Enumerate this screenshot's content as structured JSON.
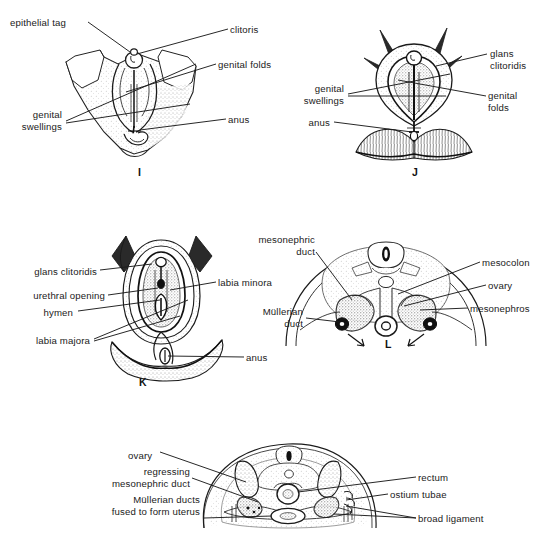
{
  "figure": {
    "background_color": "#ffffff",
    "ink_color": "#1a1a1a",
    "width": 547,
    "height": 549
  },
  "panels": [
    {
      "id": "panel-i",
      "letter": "I",
      "letter_pos": {
        "x": 138,
        "y": 168
      },
      "type": "external-genitalia-perineum",
      "labels": [
        {
          "name": "epithelial-tag",
          "text": "epithelial tag",
          "x": 10,
          "y": 17,
          "align": "left"
        },
        {
          "name": "clitoris",
          "text": "clitoris",
          "x": 230,
          "y": 24,
          "align": "left"
        },
        {
          "name": "genital-folds",
          "text": "genital folds",
          "x": 218,
          "y": 59,
          "align": "left"
        },
        {
          "name": "genital-swellings",
          "text": "genital\nswellings",
          "x": 62,
          "y": 109,
          "align": "right"
        },
        {
          "name": "anus",
          "text": "anus",
          "x": 228,
          "y": 114,
          "align": "left"
        }
      ]
    },
    {
      "id": "panel-j",
      "letter": "J",
      "letter_pos": {
        "x": 412,
        "y": 168
      },
      "type": "external-genitalia-clitoral-hypertrophy",
      "labels": [
        {
          "name": "glans-clitoridis",
          "text": "glans\nclitoridis",
          "x": 490,
          "y": 48,
          "align": "left"
        },
        {
          "name": "genital-swellings",
          "text": "genital\nswellings",
          "x": 344,
          "y": 83,
          "align": "right"
        },
        {
          "name": "genital-folds",
          "text": "genital\nfolds",
          "x": 488,
          "y": 90,
          "align": "left"
        },
        {
          "name": "anus",
          "text": "anus",
          "x": 330,
          "y": 117,
          "align": "right"
        }
      ]
    },
    {
      "id": "panel-k",
      "letter": "K",
      "letter_pos": {
        "x": 139,
        "y": 378
      },
      "type": "definitive-female-external-genitalia",
      "labels": [
        {
          "name": "glans-clitoridis",
          "text": "glans clitoridis",
          "x": 97,
          "y": 266,
          "align": "right"
        },
        {
          "name": "labia-minora",
          "text": "labia minora",
          "x": 218,
          "y": 277,
          "align": "left"
        },
        {
          "name": "urethral-opening",
          "text": "urethral opening",
          "x": 105,
          "y": 290,
          "align": "right"
        },
        {
          "name": "hymen",
          "text": "hymen",
          "x": 73,
          "y": 307,
          "align": "right"
        },
        {
          "name": "labia-majora",
          "text": "labia majora",
          "x": 90,
          "y": 335,
          "align": "right"
        },
        {
          "name": "anus",
          "text": "anus",
          "x": 246,
          "y": 352,
          "align": "left"
        }
      ]
    },
    {
      "id": "panel-l",
      "letter": "L",
      "letter_pos": {
        "x": 385,
        "y": 340
      },
      "type": "transverse-section-gonads-ducts",
      "labels": [
        {
          "name": "mesonephric-duct",
          "text": "mesonephric\nduct",
          "x": 315,
          "y": 234,
          "align": "right"
        },
        {
          "name": "mesocolon",
          "text": "mesocolon",
          "x": 482,
          "y": 257,
          "align": "left"
        },
        {
          "name": "ovary",
          "text": "ovary",
          "x": 488,
          "y": 280,
          "align": "left"
        },
        {
          "name": "mesonephros",
          "text": "mesonephros",
          "x": 470,
          "y": 303,
          "align": "left"
        },
        {
          "name": "mullerian-duct",
          "text": "Müllerian\nduct",
          "x": 303,
          "y": 306,
          "align": "right"
        }
      ]
    },
    {
      "id": "panel-m",
      "letter": "",
      "letter_pos": null,
      "type": "transverse-section-uterus-broad-ligament",
      "labels": [
        {
          "name": "ovary",
          "text": "ovary",
          "x": 128,
          "y": 450,
          "align": "left"
        },
        {
          "name": "regressing-mesonephric-duct",
          "text": "regressing\nmesonephric duct",
          "x": 190,
          "y": 473,
          "align": "right"
        },
        {
          "name": "rectum",
          "text": "rectum",
          "x": 418,
          "y": 472,
          "align": "left"
        },
        {
          "name": "ostium-tubae",
          "text": "ostium tubae",
          "x": 390,
          "y": 489,
          "align": "left"
        },
        {
          "name": "mullerian-ducts-fused",
          "text": "Müllerian ducts\nfused to form uterus",
          "x": 200,
          "y": 501,
          "align": "right"
        },
        {
          "name": "broad-ligament",
          "text": "broad ligament",
          "x": 418,
          "y": 513,
          "align": "left"
        }
      ]
    }
  ]
}
